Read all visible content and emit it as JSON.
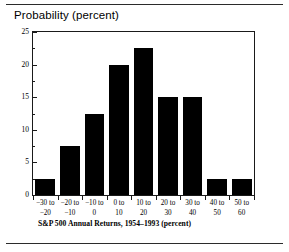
{
  "figure": {
    "rule_color": "#2b2b2b",
    "background": "#ffffff"
  },
  "chart_data": {
    "type": "bar",
    "title": "Probability (percent)",
    "xlabel": "S&P 500 Annual Returns, 1954–1993 (percent)",
    "ylabel": "",
    "bar_color": "#000000",
    "axis_color": "#1a1a1a",
    "grid": false,
    "legend": null,
    "ylim": [
      0,
      25
    ],
    "yticks": [
      0,
      5,
      10,
      15,
      20,
      25
    ],
    "ytick_labels": [
      "0",
      "5",
      "10",
      "15",
      "20",
      "25"
    ],
    "yminor_ticks": [
      2.5,
      7.5,
      12.5,
      17.5,
      22.5
    ],
    "categories": [
      "−30 to −20",
      "−20 to −10",
      "−10 to 0",
      "0 to 10",
      "10 to 20",
      "20 to 30",
      "30 to 40",
      "40 to 50",
      "50 to 60"
    ],
    "category_lines": [
      {
        "line1": "−30 to",
        "line2": "−20"
      },
      {
        "line1": "−20 to",
        "line2": "−10"
      },
      {
        "line1": "−10 to",
        "line2": "0"
      },
      {
        "line1": "0 to",
        "line2": "10"
      },
      {
        "line1": "10 to",
        "line2": "20"
      },
      {
        "line1": "20 to",
        "line2": "30"
      },
      {
        "line1": "30 to",
        "line2": "40"
      },
      {
        "line1": "40 to",
        "line2": "50"
      },
      {
        "line1": "50 to",
        "line2": "60"
      }
    ],
    "values": [
      2.5,
      7.5,
      12.5,
      20,
      22.5,
      15,
      15,
      2.5,
      2.5
    ]
  }
}
